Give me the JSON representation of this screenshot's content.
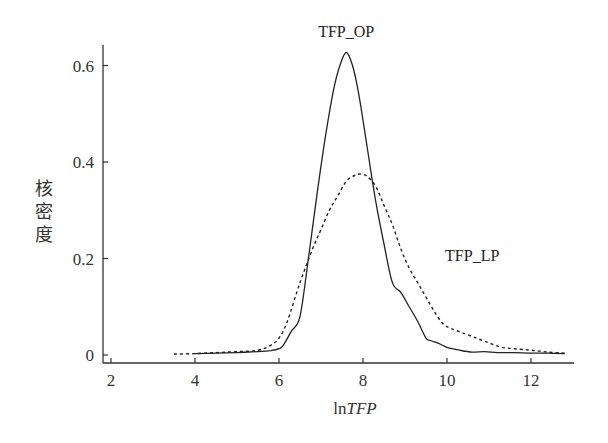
{
  "chart_data": {
    "type": "line",
    "title": "",
    "xlabel": "lnTFP",
    "xlabel_parts": {
      "prefix": "ln",
      "italic": "TFP"
    },
    "ylabel": "核密度",
    "xlim": [
      1.8,
      13.0
    ],
    "ylim": [
      -0.02,
      0.66
    ],
    "xticks": [
      2,
      4,
      6,
      8,
      10,
      12
    ],
    "yticks": [
      0,
      0.2,
      0.4,
      0.6
    ],
    "ytick_labels": [
      "0",
      "0.2",
      "0.4",
      "0.6"
    ],
    "grid": false,
    "legend": "inline annotations",
    "series": [
      {
        "name": "TFP_OP",
        "style": "solid",
        "label_pos": {
          "x": 7.6,
          "y": 0.66
        },
        "x": [
          4.0,
          4.5,
          5.0,
          5.5,
          5.8,
          6.0,
          6.1,
          6.3,
          6.5,
          6.7,
          6.9,
          7.1,
          7.3,
          7.45,
          7.6,
          7.75,
          7.9,
          8.1,
          8.3,
          8.5,
          8.7,
          8.9,
          9.1,
          9.3,
          9.5,
          9.6,
          9.8,
          10.0,
          10.3,
          10.6,
          10.9,
          11.2,
          11.6,
          12.0,
          12.4,
          12.8
        ],
        "y": [
          0.003,
          0.004,
          0.005,
          0.007,
          0.009,
          0.013,
          0.02,
          0.05,
          0.08,
          0.2,
          0.33,
          0.45,
          0.55,
          0.6,
          0.627,
          0.6,
          0.54,
          0.43,
          0.32,
          0.23,
          0.15,
          0.13,
          0.1,
          0.07,
          0.035,
          0.03,
          0.024,
          0.016,
          0.01,
          0.006,
          0.007,
          0.005,
          0.005,
          0.004,
          0.004,
          0.003
        ]
      },
      {
        "name": "TFP_LP",
        "style": "dashed",
        "label_pos": {
          "x": 10.6,
          "y": 0.195
        },
        "x": [
          3.5,
          4.0,
          4.5,
          5.0,
          5.5,
          5.8,
          6.0,
          6.2,
          6.5,
          6.8,
          7.0,
          7.2,
          7.4,
          7.6,
          7.8,
          7.95,
          8.1,
          8.3,
          8.5,
          8.7,
          8.9,
          9.1,
          9.3,
          9.5,
          9.7,
          9.9,
          10.1,
          10.4,
          10.7,
          11.0,
          11.3,
          11.6,
          12.0,
          12.4,
          12.8
        ],
        "y": [
          0.002,
          0.003,
          0.005,
          0.007,
          0.01,
          0.02,
          0.035,
          0.07,
          0.15,
          0.22,
          0.26,
          0.3,
          0.33,
          0.36,
          0.372,
          0.375,
          0.37,
          0.35,
          0.31,
          0.27,
          0.22,
          0.18,
          0.15,
          0.12,
          0.09,
          0.065,
          0.055,
          0.045,
          0.035,
          0.025,
          0.016,
          0.013,
          0.01,
          0.006,
          0.004
        ]
      }
    ],
    "colors": {
      "line": "#222222",
      "axis": "#333333",
      "background": "#ffffff"
    }
  }
}
